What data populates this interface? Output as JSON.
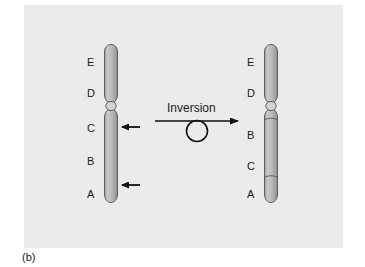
{
  "figure": {
    "caption": "(b)",
    "panel_color": "#ebebeb",
    "page_color": "#ffffff",
    "chromosome_fill": "#b5b5b5",
    "chromosome_outline": "#4a4a4a",
    "ink_color": "#1a1a1a"
  },
  "operation": {
    "label": "Inversion",
    "arrow_icon": "right-arrow-icon",
    "loop_icon": "inversion-loop-circle-icon"
  },
  "chromosome_before": {
    "name": "original chromosome",
    "segments": [
      {
        "id": "E",
        "label": "E"
      },
      {
        "id": "D",
        "label": "D"
      },
      {
        "id": "C",
        "label": "C"
      },
      {
        "id": "B",
        "label": "B"
      },
      {
        "id": "A",
        "label": "A"
      }
    ],
    "breakpoints": [
      {
        "id": "upper-breakpoint",
        "icon": "left-pointing-arrow-icon"
      },
      {
        "id": "lower-breakpoint",
        "icon": "left-pointing-arrow-icon"
      }
    ],
    "centromere": "centromere-constriction"
  },
  "chromosome_after": {
    "name": "inverted chromosome",
    "segments": [
      {
        "id": "E",
        "label": "E"
      },
      {
        "id": "D",
        "label": "D"
      },
      {
        "id": "B",
        "label": "B"
      },
      {
        "id": "C",
        "label": "C"
      },
      {
        "id": "A",
        "label": "A"
      }
    ],
    "centromere": "centromere-constriction"
  }
}
